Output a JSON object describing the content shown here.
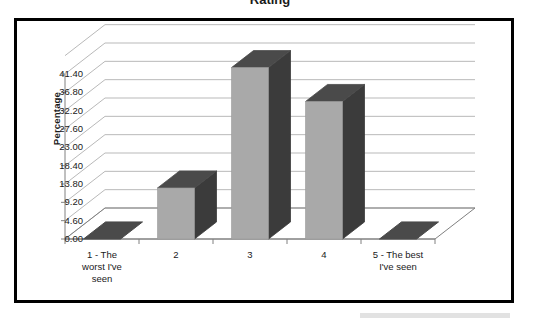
{
  "page": {
    "background_color": "#ffffff",
    "frame_color": "#000000",
    "clipped_title": "Rating"
  },
  "chart_data": {
    "type": "bar",
    "title": "",
    "xlabel": "",
    "ylabel": "Percentage",
    "categories": [
      "1 - The worst I've seen",
      "2",
      "3",
      "4",
      "5 - The best I've seen"
    ],
    "values": [
      0,
      12.8,
      43.0,
      34.5,
      0
    ],
    "ylim": [
      0,
      46
    ],
    "ytick_labels": [
      "0.00",
      "4.60",
      "9.20",
      "13.80",
      "18.40",
      "23.00",
      "27.60",
      "32.20",
      "36.80",
      "41.40"
    ],
    "ytick_values": [
      0,
      4.6,
      9.2,
      13.8,
      18.4,
      23.0,
      27.6,
      32.2,
      36.8,
      41.4
    ],
    "grid": true,
    "legend": "none",
    "style": "3d-column",
    "colors": {
      "bar_front": "#a9a9a9",
      "bar_side": "#3b3b3b",
      "bar_top": "#4a4a4a",
      "gridline": "#b9b9b9",
      "axis": "#808080",
      "text": "#1a1a1a"
    }
  },
  "axis_labels": {
    "x_lines": [
      [
        "1 - The",
        "worst I've",
        "seen"
      ],
      [
        "2"
      ],
      [
        "3"
      ],
      [
        "4"
      ],
      [
        "5 - The best",
        "I've seen"
      ]
    ]
  }
}
